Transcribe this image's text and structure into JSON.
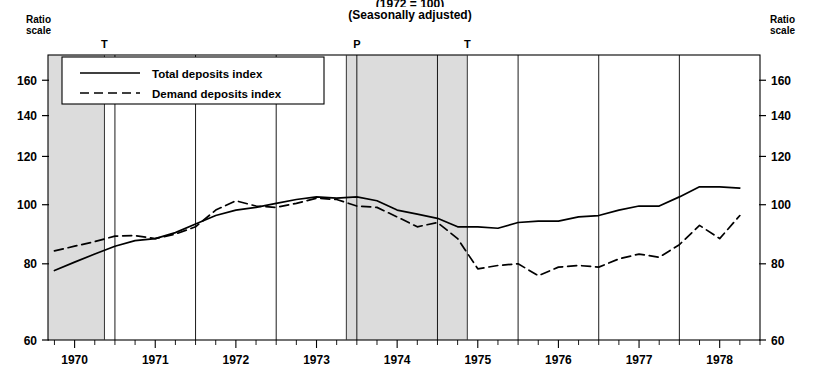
{
  "title": {
    "line1": "(1972 = 100)",
    "line2": "(Seasonally adjusted)"
  },
  "axis_notes": {
    "left": "Ratio\nscale",
    "left_l1": "Ratio",
    "left_l2": "scale",
    "right_l1": "Ratio",
    "right_l2": "scale"
  },
  "legend": {
    "items": [
      {
        "label": "Total deposits index",
        "style": "solid"
      },
      {
        "label": "Demand deposits index",
        "style": "dashed"
      }
    ]
  },
  "cycle_markers": [
    {
      "label": "T",
      "x_year": 1970.37
    },
    {
      "label": "P",
      "x_year": 1973.5
    },
    {
      "label": "T",
      "x_year": 1974.87
    }
  ],
  "chart_data": {
    "type": "line",
    "title": "(1972 = 100)",
    "subtitle": "(Seasonally adjusted)",
    "xlabel": "",
    "ylabel": "",
    "yscale": "log",
    "ylim": [
      60,
      176
    ],
    "yticks": [
      60,
      80,
      100,
      120,
      140,
      160
    ],
    "xlim": [
      1969.67,
      1978.5
    ],
    "xticks": [
      1970,
      1971,
      1972,
      1973,
      1974,
      1975,
      1976,
      1977,
      1978
    ],
    "xtick_labels": [
      "1970",
      "1971",
      "1972",
      "1973",
      "1974",
      "1975",
      "1976",
      "1977",
      "1978"
    ],
    "grid": false,
    "legend_position": "upper-left",
    "shaded_bands": [
      {
        "start": 1969.67,
        "end": 1970.37,
        "color": "#dcdcdc",
        "note": "recession"
      },
      {
        "start": 1973.37,
        "end": 1974.87,
        "color": "#dcdcdc",
        "note": "recession"
      }
    ],
    "series": [
      {
        "name": "Total deposits index",
        "style": "solid",
        "color": "#000000",
        "x": [
          1969.75,
          1970.0,
          1970.25,
          1970.5,
          1970.75,
          1971.0,
          1971.25,
          1971.5,
          1971.75,
          1972.0,
          1972.25,
          1972.5,
          1972.75,
          1973.0,
          1973.25,
          1973.5,
          1973.75,
          1974.0,
          1974.25,
          1974.5,
          1974.75,
          1975.0,
          1975.25,
          1975.5,
          1975.75,
          1976.0,
          1976.25,
          1976.5,
          1976.75,
          1977.0,
          1977.25,
          1977.5,
          1977.75,
          1978.0,
          1978.25
        ],
        "y": [
          78.0,
          80.5,
          83.0,
          85.5,
          87.3,
          88.0,
          90.0,
          93.0,
          96.0,
          98.0,
          99.0,
          100.5,
          102.0,
          103.0,
          102.5,
          103.0,
          101.5,
          98.0,
          96.5,
          95.0,
          92.0,
          92.0,
          91.5,
          93.5,
          94.0,
          94.0,
          95.5,
          96.0,
          98.0,
          99.5,
          99.5,
          103.0,
          107.0,
          107.0,
          106.5
        ]
      },
      {
        "name": "Demand deposits index",
        "style": "dashed",
        "color": "#000000",
        "x": [
          1969.75,
          1970.0,
          1970.25,
          1970.5,
          1970.75,
          1971.0,
          1971.25,
          1971.5,
          1971.75,
          1972.0,
          1972.25,
          1972.5,
          1972.75,
          1973.0,
          1973.25,
          1973.5,
          1973.75,
          1974.0,
          1974.25,
          1974.5,
          1974.75,
          1975.0,
          1975.25,
          1975.5,
          1975.75,
          1976.0,
          1976.25,
          1976.5,
          1976.75,
          1977.0,
          1977.25,
          1977.5,
          1977.75,
          1978.0,
          1978.25
        ],
        "y": [
          84.0,
          85.5,
          87.0,
          88.8,
          89.0,
          88.0,
          89.5,
          92.0,
          98.0,
          101.5,
          99.5,
          99.0,
          100.5,
          102.5,
          102.0,
          99.5,
          99.0,
          95.5,
          92.0,
          93.5,
          88.0,
          78.5,
          79.5,
          80.0,
          76.5,
          79.0,
          79.5,
          79.0,
          81.5,
          83.0,
          82.0,
          86.0,
          92.5,
          88.0,
          96.0
        ]
      }
    ]
  }
}
